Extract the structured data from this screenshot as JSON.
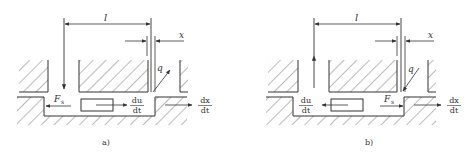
{
  "figure": {
    "panels": [
      {
        "id": "a",
        "caption": "a)",
        "labels": {
          "length": "l",
          "opening": "x",
          "flow": "q",
          "force": "F",
          "force_sub": "s",
          "spool_vel_num": "du",
          "spool_vel_den": "dt",
          "x_vel_num": "dx",
          "x_vel_den": "dt"
        }
      },
      {
        "id": "b",
        "caption": "b)",
        "labels": {
          "length": "l",
          "opening": "x",
          "flow": "q",
          "force": "F",
          "force_sub": "s",
          "spool_vel_num": "du",
          "spool_vel_den": "dt",
          "x_vel_num": "dx",
          "x_vel_den": "dt"
        }
      }
    ],
    "colors": {
      "line": "#333333",
      "hatch": "#555555",
      "background": "#ffffff"
    }
  }
}
